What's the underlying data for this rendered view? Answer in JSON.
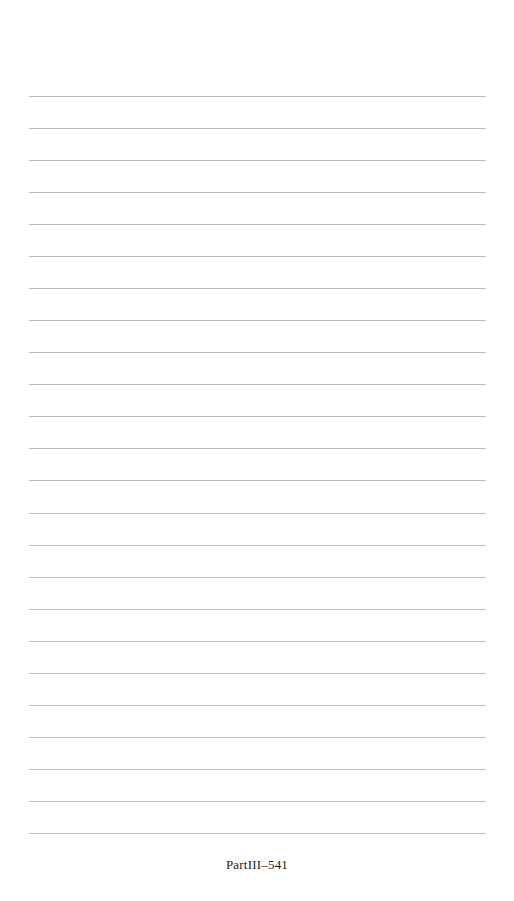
{
  "page": {
    "background": "#ffffff",
    "rule_color": "#bdbdbd",
    "rule_count": 24,
    "rule_first_y": 96,
    "rule_spacing": 32.04,
    "rule_left": 29,
    "rule_right": 486
  },
  "footer": {
    "page_number": "PartIII–541"
  }
}
